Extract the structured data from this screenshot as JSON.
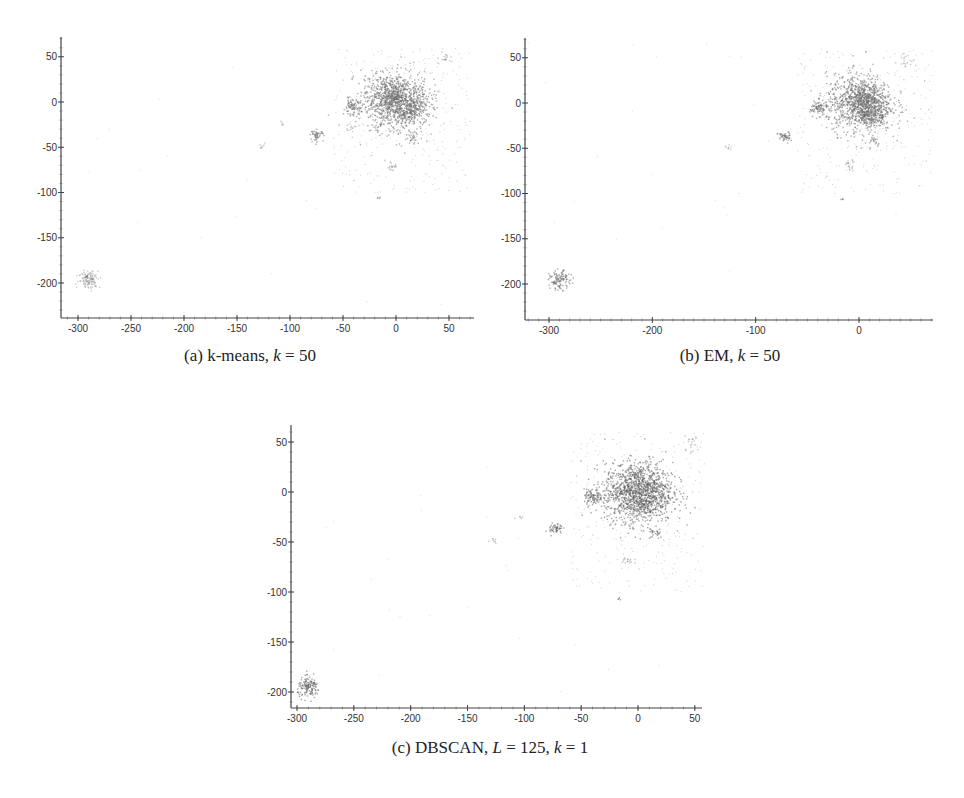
{
  "figure": {
    "panels": [
      {
        "id": "a",
        "caption_prefix": "(a) k-means, ",
        "caption_param1_var": "k",
        "caption_param1_eq": " = 50",
        "caption_param2_var": "",
        "caption_param2_eq": ""
      },
      {
        "id": "b",
        "caption_prefix": "(b) EM, ",
        "caption_param1_var": "k",
        "caption_param1_eq": " = 50",
        "caption_param2_var": "",
        "caption_param2_eq": ""
      },
      {
        "id": "c",
        "caption_prefix": "(c) DBSCAN, ",
        "caption_param1_var": "L",
        "caption_param1_eq": " = 125, ",
        "caption_param2_var": "k",
        "caption_param2_eq": " = 1"
      }
    ]
  },
  "chart_data": [
    {
      "type": "scatter",
      "title": "(a) k-means, k = 50",
      "xlabel": "",
      "ylabel": "",
      "xlim": [
        -325,
        72
      ],
      "ylim": [
        -240,
        72
      ],
      "xticks": [
        -300,
        -250,
        -200,
        -150,
        -100,
        -50,
        0,
        50
      ],
      "yticks": [
        50,
        0,
        -50,
        -100,
        -150,
        -200
      ],
      "grid": false,
      "legend": null,
      "point_color": "#6e6e6e",
      "clusters": [
        {
          "x": 0,
          "y": 0,
          "spread": 16,
          "n": 900,
          "density": "dense"
        },
        {
          "x": -8,
          "y": 10,
          "spread": 9,
          "n": 250,
          "density": "dense"
        },
        {
          "x": 12,
          "y": -8,
          "spread": 9,
          "n": 200,
          "density": "dense"
        },
        {
          "x": -42,
          "y": -5,
          "spread": 4,
          "n": 80,
          "density": "dense"
        },
        {
          "x": -75,
          "y": -36,
          "spread": 3,
          "n": 50,
          "density": "dense"
        },
        {
          "x": -290,
          "y": -195,
          "spread": 5,
          "n": 120,
          "density": "light"
        },
        {
          "x": -5,
          "y": -70,
          "spread": 3,
          "n": 20,
          "density": "light"
        },
        {
          "x": 15,
          "y": -40,
          "spread": 3,
          "n": 20,
          "density": "dense"
        },
        {
          "x": -42,
          "y": -28,
          "spread": 3,
          "n": 15,
          "density": "light"
        },
        {
          "x": 45,
          "y": 50,
          "spread": 4,
          "n": 20,
          "density": "light"
        },
        {
          "x": -127,
          "y": -48,
          "spread": 2,
          "n": 8,
          "density": "light"
        },
        {
          "x": -16,
          "y": -105,
          "spread": 1,
          "n": 4,
          "density": "dense"
        },
        {
          "x": -108,
          "y": -23,
          "spread": 1.5,
          "n": 5,
          "density": "light"
        }
      ],
      "noise": {
        "x_range": [
          -60,
          70
        ],
        "y_range": [
          -100,
          60
        ],
        "n": 300
      }
    },
    {
      "type": "scatter",
      "title": "(b) EM, k = 50",
      "xlabel": "",
      "ylabel": "",
      "xlim": [
        -330,
        72
      ],
      "ylim": [
        -240,
        72
      ],
      "xticks": [
        -300,
        -200,
        -100,
        0
      ],
      "yticks": [
        50,
        0,
        -50,
        -100,
        -150,
        -200
      ],
      "grid": false,
      "legend": null,
      "point_color": "#6e6e6e",
      "clusters": [
        {
          "x": 0,
          "y": 0,
          "spread": 16,
          "n": 900,
          "density": "dense"
        },
        {
          "x": 5,
          "y": 5,
          "spread": 8,
          "n": 250,
          "density": "dense"
        },
        {
          "x": 12,
          "y": -12,
          "spread": 8,
          "n": 200,
          "density": "dense"
        },
        {
          "x": -40,
          "y": -5,
          "spread": 4,
          "n": 80,
          "density": "dense"
        },
        {
          "x": -73,
          "y": -37,
          "spread": 3,
          "n": 50,
          "density": "dense"
        },
        {
          "x": -290,
          "y": -195,
          "spread": 5,
          "n": 120,
          "density": "dense"
        },
        {
          "x": -10,
          "y": -68,
          "spread": 3,
          "n": 20,
          "density": "light"
        },
        {
          "x": 15,
          "y": -40,
          "spread": 3,
          "n": 20,
          "density": "dense"
        },
        {
          "x": 45,
          "y": 48,
          "spread": 4,
          "n": 20,
          "density": "light"
        },
        {
          "x": -127,
          "y": -48,
          "spread": 2,
          "n": 8,
          "density": "light"
        },
        {
          "x": -17,
          "y": -106,
          "spread": 1,
          "n": 4,
          "density": "dense"
        }
      ],
      "noise": {
        "x_range": [
          -60,
          70
        ],
        "y_range": [
          -100,
          60
        ],
        "n": 300
      }
    },
    {
      "type": "scatter",
      "title": "(c) DBSCAN, L = 125, k = 1",
      "xlabel": "",
      "ylabel": "",
      "xlim": [
        -308,
        58
      ],
      "ylim": [
        -218,
        67
      ],
      "xticks": [
        -300,
        -250,
        -200,
        -150,
        -100,
        -50,
        0,
        50
      ],
      "yticks": [
        50,
        0,
        -50,
        -100,
        -150,
        -200
      ],
      "grid": false,
      "legend": null,
      "point_color": "#5e5e5e",
      "clusters": [
        {
          "x": 0,
          "y": 0,
          "spread": 15,
          "n": 1400,
          "density": "dense"
        },
        {
          "x": -40,
          "y": -5,
          "spread": 4,
          "n": 90,
          "density": "dense"
        },
        {
          "x": -73,
          "y": -36,
          "spread": 3,
          "n": 50,
          "density": "dense"
        },
        {
          "x": -290,
          "y": -195,
          "spread": 5,
          "n": 140,
          "density": "dense"
        },
        {
          "x": -10,
          "y": -68,
          "spread": 3,
          "n": 15,
          "density": "light"
        },
        {
          "x": 15,
          "y": -40,
          "spread": 3,
          "n": 25,
          "density": "dense"
        },
        {
          "x": 45,
          "y": 48,
          "spread": 4,
          "n": 20,
          "density": "light"
        },
        {
          "x": -127,
          "y": -48,
          "spread": 2,
          "n": 8,
          "density": "light"
        },
        {
          "x": -17,
          "y": -106,
          "spread": 1,
          "n": 4,
          "density": "dense"
        },
        {
          "x": -105,
          "y": -24,
          "spread": 1.5,
          "n": 5,
          "density": "light"
        }
      ],
      "noise": {
        "x_range": [
          -60,
          58
        ],
        "y_range": [
          -100,
          60
        ],
        "n": 300
      }
    }
  ]
}
